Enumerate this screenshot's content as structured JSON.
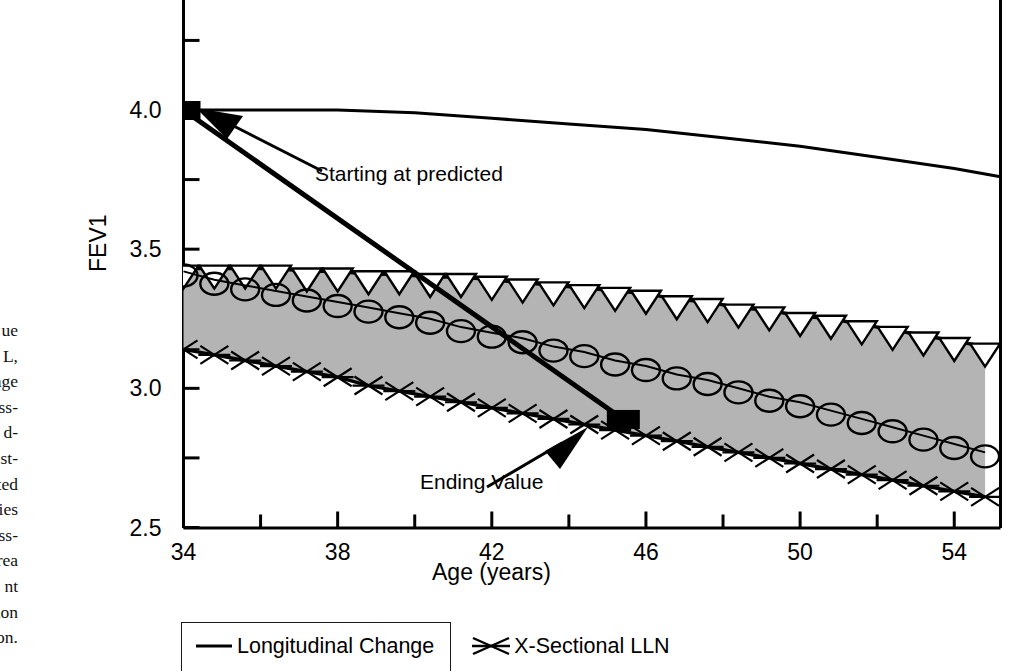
{
  "caption_fragment": {
    "lines": [
      "ue",
      "00 L,",
      "age",
      "oss-",
      "d-",
      "st-",
      "pected",
      "udies",
      "cross-",
      "rea",
      "nt",
      "dition",
      "ion."
    ]
  },
  "legend": {
    "items": [
      {
        "label": "Longitudinal Change",
        "marker": "line-marker"
      },
      {
        "label": "X-Sectional LLN",
        "marker": "x-marker"
      }
    ]
  },
  "annotations": [
    {
      "name": "starting-at-predicted",
      "text": "Starting at predicted"
    },
    {
      "name": "ending-value",
      "text": "Ending Value"
    }
  ],
  "chart_data": {
    "type": "line",
    "title": "",
    "xlabel": "Age (years)",
    "ylabel": "FEV1",
    "xlim": [
      34,
      55.2
    ],
    "ylim": [
      2.5,
      4.24
    ],
    "xticks": [
      34,
      36,
      38,
      40,
      42,
      44,
      46,
      48,
      50,
      52,
      54
    ],
    "xticklabels": [
      "34",
      "",
      "38",
      "",
      "42",
      "",
      "46",
      "",
      "50",
      "",
      "54"
    ],
    "yticks": [
      2.5,
      2.75,
      3.0,
      3.25,
      3.5,
      3.75,
      4.0,
      4.25
    ],
    "yticklabels": [
      "2.5",
      "",
      "3.0",
      "",
      "3.5",
      "",
      "4.0",
      ""
    ],
    "grid": false,
    "legend_position": "bottom-left",
    "shaded_band": {
      "name": "normal-range-band",
      "color": "#b4b4b4",
      "between": [
        "x-sectional-predicted",
        "x-sectional-lln"
      ]
    },
    "series": [
      {
        "name": "predicted-normal",
        "label": "Predicted",
        "marker": "none",
        "x": [
          34,
          36,
          38,
          40,
          42,
          44,
          46,
          48,
          50,
          52,
          54,
          55.2
        ],
        "y": [
          4.0,
          4.0,
          4.0,
          3.99,
          3.97,
          3.95,
          3.93,
          3.9,
          3.87,
          3.83,
          3.79,
          3.76
        ]
      },
      {
        "name": "x-sectional-predicted",
        "label": "X-Sectional Predicted",
        "marker": "triangle-down",
        "x": [
          34,
          34.8,
          35.6,
          36.4,
          37.2,
          38,
          38.8,
          39.6,
          40.4,
          41.2,
          42,
          42.8,
          43.6,
          44.4,
          45.2,
          46,
          46.8,
          47.6,
          48.4,
          49.2,
          50,
          50.8,
          51.6,
          52.4,
          53.2,
          54,
          54.8
        ],
        "y": [
          3.43,
          3.43,
          3.43,
          3.43,
          3.42,
          3.42,
          3.41,
          3.41,
          3.4,
          3.4,
          3.39,
          3.38,
          3.37,
          3.36,
          3.35,
          3.34,
          3.32,
          3.31,
          3.29,
          3.28,
          3.26,
          3.25,
          3.23,
          3.21,
          3.19,
          3.17,
          3.15
        ]
      },
      {
        "name": "longitudinal-change",
        "label": "Longitudinal Change",
        "marker": "circle",
        "x": [
          34,
          34.8,
          35.6,
          36.4,
          37.2,
          38,
          38.8,
          39.6,
          40.4,
          41.2,
          42,
          42.8,
          43.6,
          44.4,
          45.2,
          46,
          46.8,
          47.6,
          48.4,
          49.2,
          50,
          50.8,
          51.6,
          52.4,
          53.2,
          54,
          54.8
        ],
        "y": [
          3.42,
          3.39,
          3.37,
          3.35,
          3.33,
          3.31,
          3.29,
          3.27,
          3.25,
          3.22,
          3.2,
          3.18,
          3.15,
          3.13,
          3.1,
          3.08,
          3.05,
          3.03,
          3.0,
          2.97,
          2.95,
          2.92,
          2.89,
          2.86,
          2.83,
          2.8,
          2.77
        ]
      },
      {
        "name": "x-sectional-lln",
        "label": "X-Sectional LLN",
        "marker": "x",
        "x": [
          34,
          34.8,
          35.6,
          36.4,
          37.2,
          38,
          38.8,
          39.6,
          40.4,
          41.2,
          42,
          42.8,
          43.6,
          44.4,
          45.2,
          46,
          46.8,
          47.6,
          48.4,
          49.2,
          50,
          50.8,
          51.6,
          52.4,
          53.2,
          54,
          54.8
        ],
        "y": [
          3.14,
          3.12,
          3.1,
          3.08,
          3.06,
          3.04,
          3.01,
          2.99,
          2.97,
          2.95,
          2.93,
          2.91,
          2.89,
          2.87,
          2.85,
          2.83,
          2.81,
          2.79,
          2.77,
          2.75,
          2.73,
          2.71,
          2.69,
          2.67,
          2.65,
          2.63,
          2.61
        ]
      }
    ],
    "markers_points": [
      {
        "name": "starting-value-marker",
        "shape": "square-filled",
        "x": 34,
        "y": 4.0
      },
      {
        "name": "ending-value-marker",
        "shape": "square-filled",
        "x": 45.4,
        "y": 2.89
      }
    ],
    "decline_line": {
      "name": "patient-decline-line",
      "from": {
        "x": 34,
        "y": 4.0
      },
      "to": {
        "x": 45.4,
        "y": 2.89
      }
    }
  }
}
